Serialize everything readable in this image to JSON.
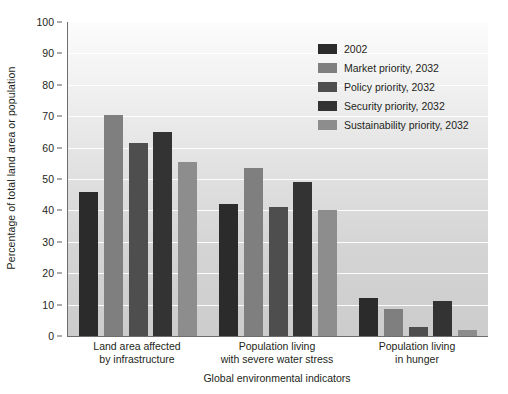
{
  "chart_data": {
    "type": "bar",
    "title": "",
    "xlabel": "Global environmental indicators",
    "ylabel": "Percentage of total land area or population",
    "ylim": [
      0,
      100
    ],
    "ytick_step": 10,
    "yticks": [
      "0",
      "10",
      "20",
      "30",
      "40",
      "50",
      "60",
      "70",
      "80",
      "90",
      "100"
    ],
    "grid": "horizontal",
    "legend_position": "top-right inside",
    "categories": [
      "Land area affected\nby infrastructure",
      "Population living\nwith severe water stress",
      "Population living\nin hunger"
    ],
    "categories_lines": [
      [
        "Land area affected",
        "by infrastructure"
      ],
      [
        "Population living",
        "with severe water stress"
      ],
      [
        "Population living",
        "in hunger"
      ]
    ],
    "series": [
      {
        "name": "2002",
        "color": "#2b2b2b",
        "values": [
          46.0,
          42.0,
          12.0
        ]
      },
      {
        "name": "Market priority, 2032",
        "color": "#7f7f7f",
        "values": [
          70.5,
          53.5,
          8.5
        ]
      },
      {
        "name": "Policy priority, 2032",
        "color": "#4e4e4e",
        "values": [
          61.5,
          41.0,
          3.0
        ]
      },
      {
        "name": "Security priority, 2032",
        "color": "#333333",
        "values": [
          65.0,
          49.0,
          11.0
        ]
      },
      {
        "name": "Sustainability priority, 2032",
        "color": "#8d8d8d",
        "values": [
          55.5,
          40.0,
          2.0
        ]
      }
    ]
  },
  "colors": {
    "plot_background_top": "#fcfcfc",
    "plot_background_bottom": "#cccccc",
    "gridline": "#ffffff",
    "axis": "#6e6e6e",
    "text": "#231f20"
  }
}
